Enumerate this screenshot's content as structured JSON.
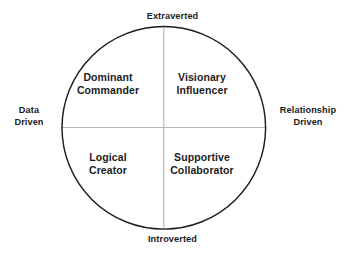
{
  "diagram": {
    "type": "quadrant-circle",
    "background_color": "#ffffff",
    "circle_stroke_color": "#1c1c1c",
    "axis_line_color": "#b4b4b4",
    "text_color": "#1c1c1c",
    "axes": {
      "top_label": "Extraverted",
      "bottom_label": "Introverted",
      "left_label_line1": "Data",
      "left_label_line2": "Driven",
      "right_label_line1": "Relationship",
      "right_label_line2": "Driven"
    },
    "quadrants": {
      "top_left": {
        "line1": "Dominant",
        "line2": "Commander"
      },
      "top_right": {
        "line1": "Visionary",
        "line2": "Influencer"
      },
      "bottom_left": {
        "line1": "Logical",
        "line2": "Creator"
      },
      "bottom_right": {
        "line1": "Supportive",
        "line2": "Collaborator"
      }
    }
  }
}
